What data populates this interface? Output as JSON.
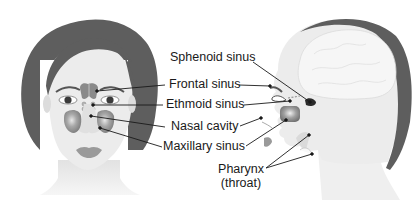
{
  "diagram": {
    "type": "anatomical-illustration",
    "views": [
      "front-view",
      "side-profile-view"
    ],
    "colors": {
      "hair": "#5e5e5e",
      "skin": "#ececec",
      "skin_shadow": "#d6d6d6",
      "sinus_fill": "#8a8a8a",
      "lips": "#9a9a9a",
      "leader_line": "#1a1a1a",
      "label_text": "#1a1a1a",
      "background": "#ffffff"
    }
  },
  "labels": {
    "sphenoid": "Sphenoid sinus",
    "frontal": "Frontal sinus",
    "ethmoid": "Ethmoid sinus",
    "nasal": "Nasal cavity",
    "maxillary": "Maxillary sinus",
    "pharynx_line1": "Pharynx",
    "pharynx_line2": "(throat)"
  }
}
